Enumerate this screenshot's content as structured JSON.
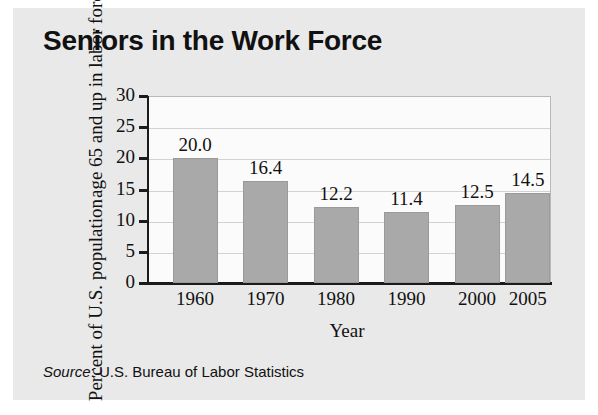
{
  "chart_data": {
    "type": "bar",
    "title": "Seniors in the Work Force",
    "xlabel": "Year",
    "ylabel_line1": "Percent of U.S. population",
    "ylabel_line2": "age 65 and up in labor force",
    "categories": [
      "1960",
      "1970",
      "1980",
      "1990",
      "2000",
      "2005"
    ],
    "values": [
      20.0,
      16.4,
      12.2,
      11.4,
      12.5,
      14.5
    ],
    "value_labels": [
      "20.0",
      "16.4",
      "12.2",
      "11.4",
      "12.5",
      "14.5"
    ],
    "ylim": [
      0,
      30
    ],
    "yticks": [
      30,
      25,
      20,
      15,
      10,
      5,
      0
    ],
    "ytick_labels": [
      "30",
      "25",
      "20",
      "15",
      "10",
      "5",
      "0"
    ],
    "grid": true,
    "legend": false,
    "bar_color": "#a9a9a9",
    "plot_background": "#fbfbfb",
    "figure_background": "#e9e9e9",
    "axis_color": "#1b1b1b",
    "grid_color": "#d2d2d2",
    "text_color": "#111111"
  },
  "source": {
    "label": "Source",
    "separator": ": ",
    "text": "U.S. Bureau of Labor Statistics"
  }
}
